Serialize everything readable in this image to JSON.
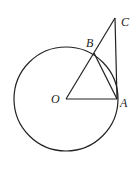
{
  "diagram": {
    "type": "geometry",
    "points": {
      "O": {
        "label": "O",
        "x": 66,
        "y": 99
      },
      "A": {
        "label": "A",
        "x": 117,
        "y": 99
      },
      "B": {
        "label": "B",
        "x": 94,
        "y": 53
      },
      "C": {
        "label": "C",
        "x": 115,
        "y": 18
      }
    },
    "circle": {
      "center": "O",
      "cx": 66,
      "cy": 99,
      "r": 52
    },
    "segments": [
      "OA",
      "OC",
      "AC",
      "AB"
    ],
    "colors": {
      "stroke": "#222222",
      "background": "#ffffff"
    }
  }
}
